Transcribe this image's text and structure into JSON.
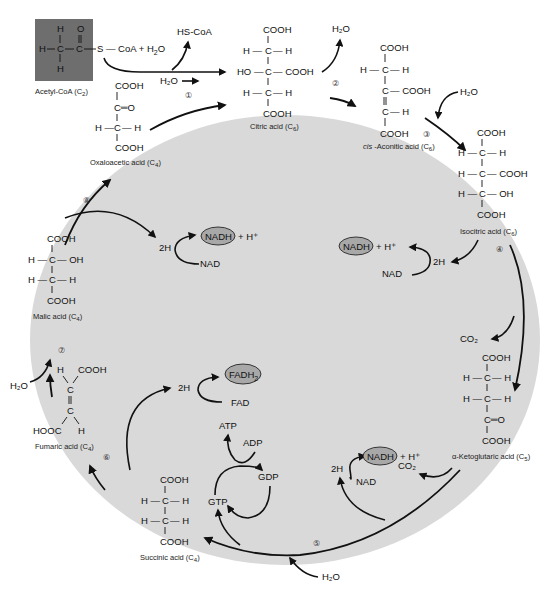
{
  "diagram": {
    "colors": {
      "cycle_fill": "#d9d9d9",
      "acetyl_box": "#6e6e6e",
      "coenzyme_ellipse": "#a8a8a8",
      "line": "#111111"
    },
    "inputs": {
      "acetyl_coa": {
        "label": "Acetyl-CoA (C",
        "sub": "2",
        "close": ")",
        "formula_tail": "S — CoA + H",
        "h2o_sub": "2",
        "o": "O"
      },
      "hs_coa": "HS-CoA",
      "h2o_step1": "H₂O"
    },
    "compounds": {
      "oxaloacetic": {
        "name": "Oxaloacetic acid (C",
        "sub": "4",
        "close": ")"
      },
      "citric": {
        "name": "Citric acid (C",
        "sub": "6",
        "close": ")"
      },
      "cis_aconitic": {
        "prefix": "cis",
        "name": " -Aconitic acid (C",
        "sub": "6",
        "close": ")"
      },
      "isocitric": {
        "name": "Isocitric acid (C",
        "sub": "6",
        "close": ")"
      },
      "ketoglutaric": {
        "name": "α-Ketoglutaric acid (C",
        "sub": "5",
        "close": ")"
      },
      "succinic": {
        "name": "Succinic acid (C",
        "sub": "4",
        "close": ")"
      },
      "fumaric": {
        "name": "Fumaric acid (C",
        "sub": "4",
        "close": ")"
      },
      "malic": {
        "name": "Malic acid (C",
        "sub": "4",
        "close": ")"
      }
    },
    "atoms": {
      "cooh": "COOH",
      "hooc": "HOOC",
      "h": "H",
      "c": "C",
      "o": "O",
      "oh": "OH",
      "ho": "HO",
      "dash_h": "H —",
      "h_dash": "— H",
      "c_dash_cooh": "C— COOH",
      "c_dash_oh": "C— OH",
      "c_eq_o": "C═O"
    },
    "byproducts": {
      "h2o_step2": "H₂O",
      "h2o_step3": "H₂O",
      "co2_step4": "CO₂",
      "co2_step5": "CO₂",
      "h2o_step5": "H₂O",
      "h2o_step7": "H₂O"
    },
    "coenzymes": {
      "nadh_step4": {
        "ellipse": "NADH",
        "plus": "+ H⁺",
        "nad": "NAD",
        "two_h": "2H"
      },
      "nadh_step5": {
        "ellipse": "NADH",
        "plus": "+ H⁺",
        "nad": "NAD",
        "two_h": "2H"
      },
      "fadh2_step6": {
        "ellipse": "FADH₂",
        "fad": "FAD",
        "two_h": "2H"
      },
      "nadh_step8": {
        "ellipse": "NADH",
        "plus": "+ H⁺",
        "nad": "NAD",
        "two_h": "2H"
      },
      "gtp": {
        "atp": "ATP",
        "adp": "ADP",
        "gdp": "GDP",
        "gtp": "GTP"
      }
    },
    "steps": [
      "①",
      "②",
      "③",
      "④",
      "⑤",
      "⑥",
      "⑦",
      "⑧"
    ]
  }
}
